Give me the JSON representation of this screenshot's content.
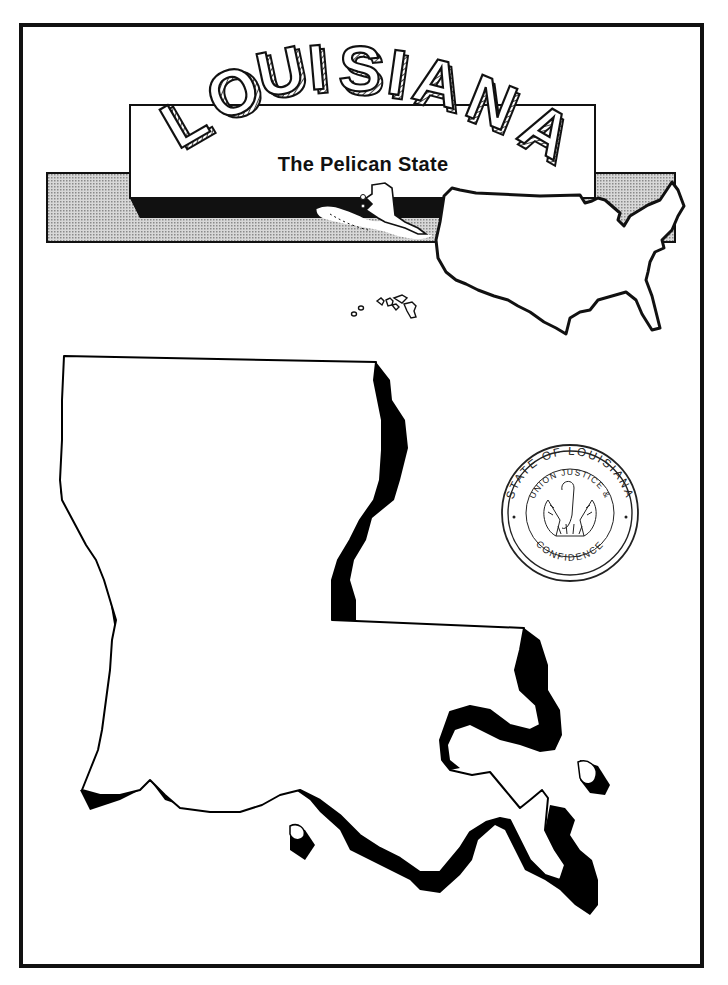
{
  "page": {
    "title": "LOUISIANA",
    "subtitle": "The Pelican State"
  },
  "banner": {
    "title_letters": [
      "L",
      "O",
      "U",
      "I",
      "S",
      "I",
      "A",
      "N",
      "A"
    ],
    "title_style": "3d-hatched-arched",
    "background_bar_color": "#bdbdbd",
    "shadow_color": "#111111"
  },
  "inset_maps": {
    "usa": {
      "label": "usa-outline-map",
      "highlight": "none"
    },
    "alaska": {
      "label": "alaska-inset"
    },
    "hawaii": {
      "label": "hawaii-islands-inset"
    }
  },
  "seal": {
    "outer_text": "STATE OF LOUISIANA",
    "inner_top_text": "UNION JUSTICE &",
    "inner_bottom_text": "CONFIDENCE",
    "emblem": "pelican-feeding-young"
  },
  "state_map": {
    "name": "Louisiana",
    "fill": "#ffffff",
    "outline": "#000000",
    "shadow": "#000000"
  },
  "colors": {
    "ink": "#111111",
    "paper": "#ffffff",
    "halftone": "#bdbdbd"
  }
}
